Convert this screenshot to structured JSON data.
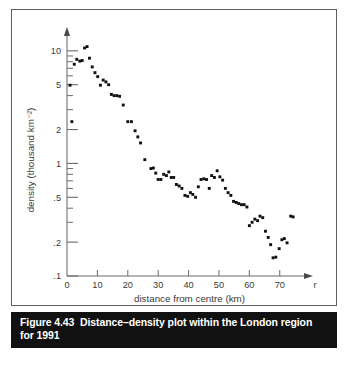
{
  "figure": {
    "caption_number": "Figure 4.43",
    "caption_text": "Distance–density plot within the London region for 1991"
  },
  "chart_data": {
    "type": "scatter",
    "title": "",
    "subtitle": "",
    "xlabel": "distance from centre (km)",
    "ylabel": "density (thousand km⁻²)",
    "x_axis_symbol": "r",
    "xlim": [
      0,
      76
    ],
    "ylim": [
      0.1,
      13
    ],
    "yscale": "log",
    "xscale": "linear",
    "grid": false,
    "legend": null,
    "xticks": [
      0,
      10,
      20,
      30,
      40,
      50,
      60,
      70
    ],
    "xticklabels": [
      "0",
      "10",
      "20",
      "30",
      "40",
      "50",
      "60",
      "70"
    ],
    "yticks": [
      10,
      5,
      2,
      1,
      0.5,
      0.2,
      0.1
    ],
    "yticklabels": [
      "10",
      "5",
      "2",
      "1",
      ".5",
      ".2",
      ".1"
    ],
    "y_minor_ticks": [
      9,
      8,
      7,
      6,
      4,
      3,
      0.9,
      0.8,
      0.7,
      0.6,
      0.4,
      0.3,
      0.09
    ],
    "marker": "square",
    "marker_color": "#111111",
    "points": [
      {
        "x": 1.0,
        "y": 4.95
      },
      {
        "x": 1.6,
        "y": 2.35
      },
      {
        "x": 2.4,
        "y": 7.6
      },
      {
        "x": 3.2,
        "y": 8.4
      },
      {
        "x": 4.2,
        "y": 8.1
      },
      {
        "x": 5.0,
        "y": 8.2
      },
      {
        "x": 5.8,
        "y": 10.6
      },
      {
        "x": 6.6,
        "y": 10.9
      },
      {
        "x": 7.4,
        "y": 8.6
      },
      {
        "x": 8.3,
        "y": 7.2
      },
      {
        "x": 9.2,
        "y": 6.4
      },
      {
        "x": 10.1,
        "y": 5.9
      },
      {
        "x": 11.0,
        "y": 4.95
      },
      {
        "x": 11.9,
        "y": 5.5
      },
      {
        "x": 12.8,
        "y": 5.3
      },
      {
        "x": 13.7,
        "y": 5.0
      },
      {
        "x": 14.6,
        "y": 4.1
      },
      {
        "x": 15.5,
        "y": 4.0
      },
      {
        "x": 16.4,
        "y": 4.0
      },
      {
        "x": 17.3,
        "y": 3.95
      },
      {
        "x": 18.5,
        "y": 3.3
      },
      {
        "x": 20.0,
        "y": 2.35
      },
      {
        "x": 21.2,
        "y": 2.35
      },
      {
        "x": 22.4,
        "y": 1.95
      },
      {
        "x": 23.3,
        "y": 1.72
      },
      {
        "x": 24.2,
        "y": 1.52
      },
      {
        "x": 25.6,
        "y": 1.08
      },
      {
        "x": 27.6,
        "y": 0.9
      },
      {
        "x": 28.4,
        "y": 0.91
      },
      {
        "x": 29.2,
        "y": 0.82
      },
      {
        "x": 30.0,
        "y": 0.72
      },
      {
        "x": 30.9,
        "y": 0.72
      },
      {
        "x": 31.8,
        "y": 0.8
      },
      {
        "x": 32.7,
        "y": 0.78
      },
      {
        "x": 33.5,
        "y": 0.84
      },
      {
        "x": 34.3,
        "y": 0.75
      },
      {
        "x": 35.1,
        "y": 0.75
      },
      {
        "x": 36.0,
        "y": 0.65
      },
      {
        "x": 36.9,
        "y": 0.63
      },
      {
        "x": 37.8,
        "y": 0.6
      },
      {
        "x": 38.8,
        "y": 0.52
      },
      {
        "x": 39.7,
        "y": 0.51
      },
      {
        "x": 40.6,
        "y": 0.55
      },
      {
        "x": 41.4,
        "y": 0.53
      },
      {
        "x": 42.3,
        "y": 0.5
      },
      {
        "x": 43.2,
        "y": 0.62
      },
      {
        "x": 44.1,
        "y": 0.72
      },
      {
        "x": 45.0,
        "y": 0.73
      },
      {
        "x": 45.9,
        "y": 0.72
      },
      {
        "x": 46.8,
        "y": 0.6
      },
      {
        "x": 47.6,
        "y": 0.78
      },
      {
        "x": 48.5,
        "y": 0.75
      },
      {
        "x": 49.4,
        "y": 0.86
      },
      {
        "x": 50.3,
        "y": 0.76
      },
      {
        "x": 51.2,
        "y": 0.71
      },
      {
        "x": 52.1,
        "y": 0.6
      },
      {
        "x": 53.0,
        "y": 0.55
      },
      {
        "x": 53.9,
        "y": 0.52
      },
      {
        "x": 54.8,
        "y": 0.46
      },
      {
        "x": 55.7,
        "y": 0.45
      },
      {
        "x": 56.5,
        "y": 0.44
      },
      {
        "x": 57.4,
        "y": 0.43
      },
      {
        "x": 58.3,
        "y": 0.43
      },
      {
        "x": 59.2,
        "y": 0.41
      },
      {
        "x": 60.0,
        "y": 0.28
      },
      {
        "x": 60.9,
        "y": 0.3
      },
      {
        "x": 61.8,
        "y": 0.32
      },
      {
        "x": 62.7,
        "y": 0.31
      },
      {
        "x": 63.5,
        "y": 0.34
      },
      {
        "x": 64.4,
        "y": 0.33
      },
      {
        "x": 65.3,
        "y": 0.25
      },
      {
        "x": 66.2,
        "y": 0.22
      },
      {
        "x": 67.0,
        "y": 0.19
      },
      {
        "x": 67.8,
        "y": 0.145
      },
      {
        "x": 68.7,
        "y": 0.147
      },
      {
        "x": 69.8,
        "y": 0.175
      },
      {
        "x": 70.7,
        "y": 0.21
      },
      {
        "x": 71.5,
        "y": 0.215
      },
      {
        "x": 72.4,
        "y": 0.197
      },
      {
        "x": 73.6,
        "y": 0.34
      },
      {
        "x": 74.4,
        "y": 0.335
      }
    ]
  }
}
